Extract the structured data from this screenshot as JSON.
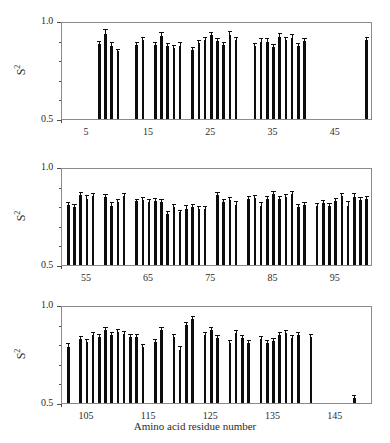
{
  "figure": {
    "xlabel": "Amino acid residue number",
    "ylabel_base": "S",
    "ylabel_exp": "2"
  },
  "chart_data": {
    "type": "bar",
    "title": "",
    "xlabel": "Amino acid residue number",
    "ylabel": "S^2",
    "ylim": [
      0.5,
      1.0
    ],
    "ytick_labels": [
      "0.5",
      "1.0"
    ],
    "ytick_values": [
      0.5,
      1.0
    ],
    "yminor_step": 0.1,
    "grid": false,
    "legend": null,
    "error_bars": true,
    "bar_color": "#0d0d0d",
    "panels": [
      {
        "name": "panel-1",
        "xlim": [
          1,
          51
        ],
        "xtick_step": 1,
        "xtick_labels": [
          "5",
          "15",
          "25",
          "35",
          "45"
        ],
        "xtick_label_values": [
          5,
          15,
          25,
          35,
          45
        ],
        "x": [
          7,
          8,
          9,
          10,
          13,
          14,
          16,
          17,
          18,
          19,
          20,
          22,
          23,
          24,
          25,
          26,
          27,
          28,
          29,
          32,
          33,
          34,
          35,
          36,
          37,
          38,
          39,
          40,
          50
        ],
        "values": [
          0.885,
          0.935,
          0.875,
          0.845,
          0.878,
          0.902,
          0.88,
          0.925,
          0.872,
          0.862,
          0.872,
          0.85,
          0.89,
          0.905,
          0.928,
          0.9,
          0.88,
          0.93,
          0.905,
          0.872,
          0.895,
          0.895,
          0.868,
          0.92,
          0.905,
          0.915,
          0.872,
          0.9,
          0.905
        ],
        "errors": [
          0.01,
          0.018,
          0.012,
          0.008,
          0.01,
          0.01,
          0.01,
          0.015,
          0.012,
          0.01,
          0.015,
          0.012,
          0.01,
          0.01,
          0.01,
          0.01,
          0.01,
          0.012,
          0.01,
          0.01,
          0.015,
          0.012,
          0.01,
          0.012,
          0.01,
          0.012,
          0.012,
          0.01,
          0.008
        ]
      },
      {
        "name": "panel-2",
        "xlim": [
          51,
          101
        ],
        "xtick_step": 1,
        "xtick_labels": [
          "55",
          "65",
          "75",
          "85",
          "95"
        ],
        "xtick_label_values": [
          55,
          65,
          75,
          85,
          95
        ],
        "x": [
          52,
          53,
          54,
          55,
          56,
          58,
          59,
          60,
          61,
          63,
          64,
          65,
          66,
          67,
          68,
          69,
          70,
          71,
          72,
          73,
          74,
          76,
          77,
          78,
          79,
          81,
          82,
          83,
          84,
          85,
          86,
          87,
          88,
          89,
          90,
          92,
          93,
          94,
          95,
          96,
          97,
          98,
          99,
          100
        ],
        "values": [
          0.805,
          0.795,
          0.855,
          0.838,
          0.852,
          0.845,
          0.802,
          0.822,
          0.852,
          0.825,
          0.83,
          0.82,
          0.828,
          0.82,
          0.76,
          0.795,
          0.768,
          0.788,
          0.795,
          0.788,
          0.788,
          0.855,
          0.822,
          0.832,
          0.808,
          0.838,
          0.842,
          0.8,
          0.838,
          0.862,
          0.838,
          0.845,
          0.862,
          0.795,
          0.808,
          0.8,
          0.818,
          0.802,
          0.828,
          0.852,
          0.8,
          0.848,
          0.832,
          0.835
        ],
        "errors": [
          0.01,
          0.01,
          0.012,
          0.012,
          0.01,
          0.01,
          0.012,
          0.01,
          0.01,
          0.008,
          0.01,
          0.01,
          0.01,
          0.01,
          0.01,
          0.012,
          0.01,
          0.012,
          0.012,
          0.01,
          0.01,
          0.012,
          0.012,
          0.012,
          0.012,
          0.01,
          0.01,
          0.018,
          0.01,
          0.01,
          0.01,
          0.012,
          0.012,
          0.01,
          0.01,
          0.01,
          0.01,
          0.01,
          0.01,
          0.012,
          0.02,
          0.012,
          0.01,
          0.01
        ]
      },
      {
        "name": "panel-3",
        "xlim": [
          101,
          151
        ],
        "xtick_step": 1,
        "xtick_labels": [
          "105",
          "115",
          "125",
          "135",
          "145"
        ],
        "xtick_label_values": [
          105,
          115,
          125,
          135,
          145
        ],
        "x": [
          102,
          104,
          105,
          106,
          107,
          108,
          109,
          110,
          111,
          112,
          113,
          114,
          116,
          117,
          119,
          120,
          121,
          122,
          124,
          125,
          126,
          128,
          129,
          130,
          131,
          133,
          134,
          135,
          136,
          137,
          138,
          139,
          141,
          148
        ],
        "values": [
          0.785,
          0.828,
          0.812,
          0.848,
          0.838,
          0.87,
          0.845,
          0.862,
          0.85,
          0.835,
          0.835,
          0.788,
          0.812,
          0.875,
          0.838,
          0.772,
          0.898,
          0.928,
          0.848,
          0.87,
          0.832,
          0.808,
          0.855,
          0.832,
          0.808,
          0.825,
          0.808,
          0.818,
          0.848,
          0.855,
          0.832,
          0.845,
          0.838,
          0.525
        ],
        "errors": [
          0.018,
          0.01,
          0.01,
          0.01,
          0.01,
          0.012,
          0.01,
          0.01,
          0.01,
          0.01,
          0.01,
          0.01,
          0.01,
          0.01,
          0.01,
          0.012,
          0.012,
          0.012,
          0.01,
          0.012,
          0.01,
          0.01,
          0.012,
          0.01,
          0.01,
          0.01,
          0.01,
          0.01,
          0.01,
          0.01,
          0.01,
          0.01,
          0.01,
          0.012
        ]
      }
    ]
  }
}
